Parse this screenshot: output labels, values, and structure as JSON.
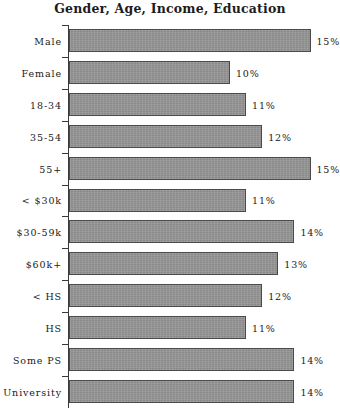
{
  "chart_data": {
    "type": "bar",
    "orientation": "horizontal",
    "title": "Gender, Age, Income, Education",
    "xlabel": "",
    "ylabel": "",
    "xlim": [
      0,
      17
    ],
    "grid": false,
    "legend": null,
    "value_suffix": "%",
    "categories": [
      "Male",
      "Female",
      "18-34",
      "35-54",
      "55+",
      "< $30k",
      "$30-59k",
      "$60k+",
      "< HS",
      "HS",
      "Some PS",
      "University"
    ],
    "values": [
      15,
      10,
      11,
      12,
      15,
      11,
      14,
      13,
      12,
      11,
      14,
      14
    ],
    "data_labels": [
      "15%",
      "10%",
      "11%",
      "12%",
      "15%",
      "11%",
      "14%",
      "13%",
      "12%",
      "11%",
      "14%",
      "14%"
    ],
    "colors": {
      "bar_fill": "#8e8e8e",
      "bar_border": "#4a4a4a",
      "axis": "#3a3a3a",
      "text": "#1a1a1a",
      "background": "#ffffff"
    }
  }
}
